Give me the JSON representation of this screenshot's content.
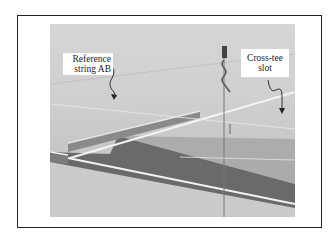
{
  "figure": {
    "labels": [
      {
        "id": "reference-string",
        "lines": [
          "Reference",
          "string AB"
        ]
      },
      {
        "id": "cross-tee-slot",
        "lines": [
          "Cross-tee",
          "slot"
        ]
      }
    ],
    "photo_description": "Suspended ceiling grid with main runner, reference string and hanger wire"
  }
}
